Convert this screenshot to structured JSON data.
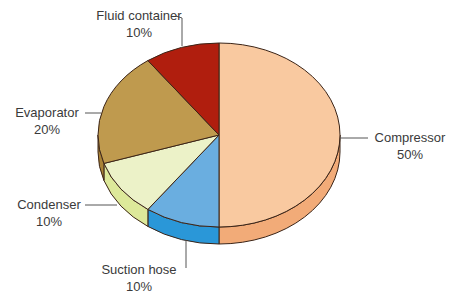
{
  "chart_data": {
    "type": "pie",
    "style": "3d",
    "title": "",
    "slices": [
      {
        "label": "Compressor",
        "value": 50,
        "value_label": "50%",
        "color": "#f9c9a0",
        "side_color": "#f2ab78"
      },
      {
        "label": "Suction hose",
        "value": 10,
        "value_label": "10%",
        "color": "#6aaee0",
        "side_color": "#2a97d8"
      },
      {
        "label": "Condenser",
        "value": 10,
        "value_label": "10%",
        "color": "#ecf2c8",
        "side_color": "#dde99a"
      },
      {
        "label": "Evaporator",
        "value": 20,
        "value_label": "20%",
        "color": "#bf9a4e",
        "side_color": "#a98236"
      },
      {
        "label": "Fluid container",
        "value": 10,
        "value_label": "10%",
        "color": "#b01e0e",
        "side_color": "#8e1608"
      }
    ],
    "geometry": {
      "cx": 219,
      "cy": 135,
      "rx": 121,
      "ry": 92,
      "depth": 17,
      "start_angle_deg": 0,
      "direction": "clockwise"
    },
    "outline_color": "#3b2417"
  },
  "labels": {
    "compressor": {
      "name": "Compressor",
      "pct": "50%"
    },
    "suction_hose": {
      "name": "Suction hose",
      "pct": "10%"
    },
    "condenser": {
      "name": "Condenser",
      "pct": "10%"
    },
    "evaporator": {
      "name": "Evaporator",
      "pct": "20%"
    },
    "fluid_container": {
      "name": "Fluid container",
      "pct": "10%"
    }
  }
}
